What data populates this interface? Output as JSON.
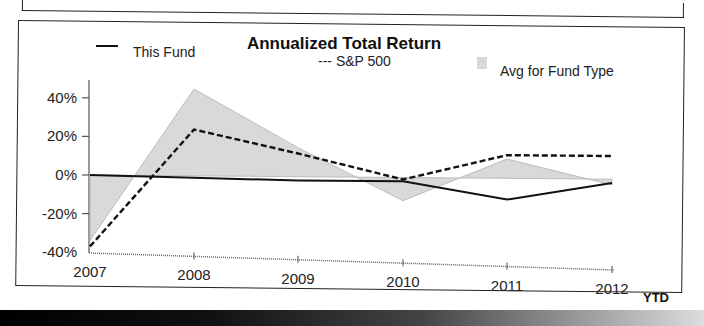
{
  "chart_data": {
    "type": "line",
    "title": "Annualized Total Return",
    "xlabel": "",
    "ylabel": "",
    "categories": [
      "2007",
      "2008",
      "2009",
      "2010",
      "2011",
      "2012"
    ],
    "x_suffix_label": "YTD",
    "yticks": [
      "40%",
      "20%",
      "0%",
      "-20%",
      "-40%"
    ],
    "ylim": [
      -40,
      45
    ],
    "grid": false,
    "legend_position": "top",
    "series": [
      {
        "name": "This Fund",
        "style": "solid line",
        "values": [
          0,
          -1,
          -2,
          -2,
          -11,
          -2
        ]
      },
      {
        "name": "S&P 500",
        "style": "dashed line",
        "values": [
          -37,
          24,
          12,
          -1,
          12,
          12
        ]
      },
      {
        "name": "Avg for Fund Type",
        "style": "shaded area",
        "values": [
          -34,
          45,
          15,
          -12,
          10,
          -3
        ]
      }
    ]
  },
  "legend": {
    "this_fund": "This Fund",
    "sp500": "--- S&P 500",
    "avg": "Avg for Fund Type"
  },
  "colors": {
    "line": "#111111",
    "area_fill": "#d9d9d9",
    "area_edge": "#b0b0b0"
  }
}
